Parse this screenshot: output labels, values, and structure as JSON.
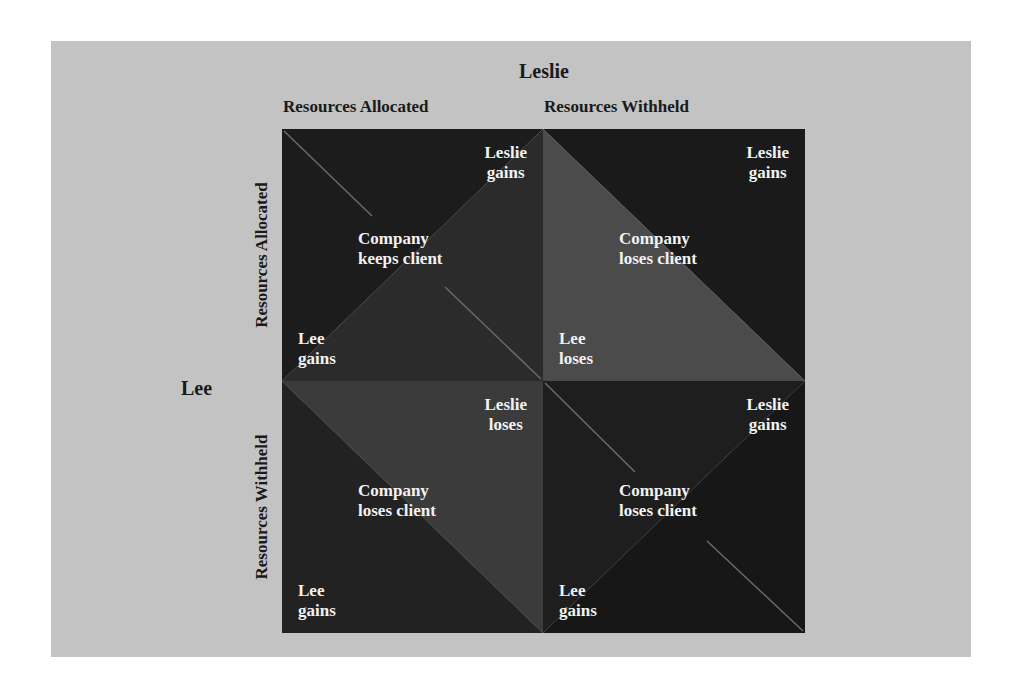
{
  "diagram": {
    "column_player": "Leslie",
    "row_player": "Lee",
    "column_labels": [
      "Resources Allocated",
      "Resources Withheld"
    ],
    "row_labels": [
      "Resources Allocated",
      "Resources Withheld"
    ],
    "colors": {
      "panel_background": "#c3c3c3",
      "label_text": "#1a1a1a",
      "cell_text": "#f2f2f2"
    },
    "cells": [
      [
        {
          "leslie": [
            "Leslie",
            "gains"
          ],
          "company": [
            "Company",
            "keeps client"
          ],
          "lee": [
            "Lee",
            "gains"
          ],
          "split": "bl-tr",
          "fill_a": "#1c1c1c",
          "fill_b": "#2b2b2b"
        },
        {
          "leslie": [
            "Leslie",
            "gains"
          ],
          "company": [
            "Company",
            "loses client"
          ],
          "lee": [
            "Lee",
            "loses"
          ],
          "split": "tl-br",
          "fill_a": "#1a1a1a",
          "fill_b": "#4b4b4b"
        }
      ],
      [
        {
          "leslie": [
            "Leslie",
            "loses"
          ],
          "company": [
            "Company",
            "loses client"
          ],
          "lee": [
            "Lee",
            "gains"
          ],
          "split": "tl-br",
          "fill_a": "#3b3b3b",
          "fill_b": "#222222"
        },
        {
          "leslie": [
            "Leslie",
            "gains"
          ],
          "company": [
            "Company",
            "loses client"
          ],
          "lee": [
            "Lee",
            "gains"
          ],
          "split": "bl-tr",
          "fill_a": "#1e1e1e",
          "fill_b": "#171717"
        }
      ]
    ]
  }
}
